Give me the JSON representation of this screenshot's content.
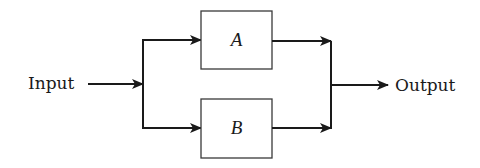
{
  "diagram": {
    "type": "parallel-block-diagram",
    "input_label": "Input",
    "output_label": "Output",
    "blocks": [
      {
        "id": "A",
        "label": "A"
      },
      {
        "id": "B",
        "label": "B"
      }
    ],
    "colors": {
      "stroke": "#1a1a1a",
      "background": "#ffffff"
    }
  }
}
